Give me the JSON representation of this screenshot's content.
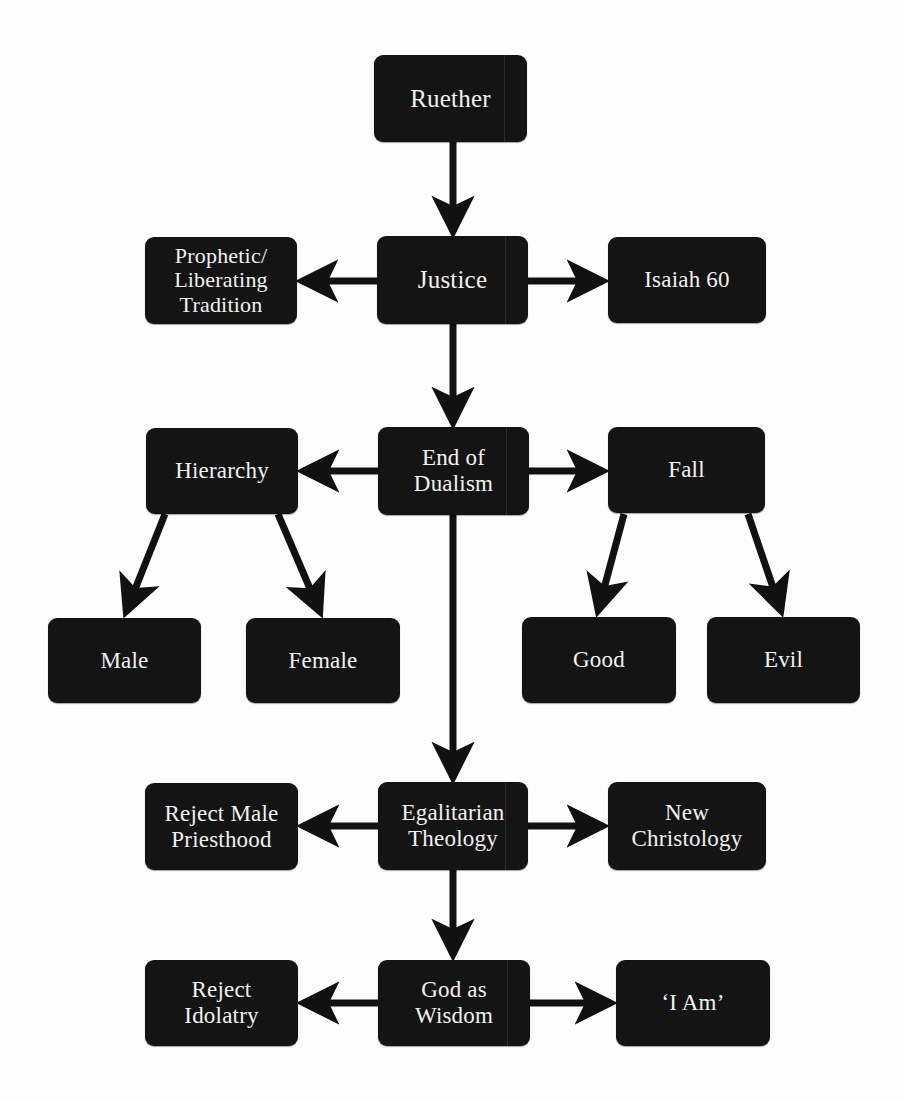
{
  "diagram": {
    "background_color": "#fdfdfc",
    "node_color": "#141414",
    "text_color": "#f2f2f0",
    "edge_color": "#111111",
    "nodes": [
      {
        "id": "ruether",
        "label": "Ruether",
        "x": 374,
        "y": 55,
        "w": 153,
        "h": 87,
        "size": "s-lg",
        "artifact": true
      },
      {
        "id": "prophetic",
        "label": "Prophetic/\nLiberating\nTradition",
        "x": 145,
        "y": 237,
        "w": 152,
        "h": 87,
        "size": "s-sm",
        "artifact": false
      },
      {
        "id": "justice",
        "label": "Justice",
        "x": 377,
        "y": 236,
        "w": 151,
        "h": 88,
        "size": "s-lg",
        "artifact": true
      },
      {
        "id": "isaiah60",
        "label": "Isaiah 60",
        "x": 608,
        "y": 237,
        "w": 158,
        "h": 86,
        "size": "s-md",
        "artifact": false
      },
      {
        "id": "hierarchy",
        "label": "Hierarchy",
        "x": 146,
        "y": 428,
        "w": 152,
        "h": 86,
        "size": "s-md",
        "artifact": false
      },
      {
        "id": "end-dualism",
        "label": "End of\nDualism",
        "x": 378,
        "y": 427,
        "w": 151,
        "h": 88,
        "size": "s-md",
        "artifact": true
      },
      {
        "id": "fall",
        "label": "Fall",
        "x": 608,
        "y": 427,
        "w": 157,
        "h": 86,
        "size": "s-md",
        "artifact": false
      },
      {
        "id": "male",
        "label": "Male",
        "x": 48,
        "y": 618,
        "w": 153,
        "h": 85,
        "size": "s-md",
        "artifact": false
      },
      {
        "id": "female",
        "label": "Female",
        "x": 246,
        "y": 618,
        "w": 154,
        "h": 85,
        "size": "s-md",
        "artifact": false
      },
      {
        "id": "good",
        "label": "Good",
        "x": 522,
        "y": 617,
        "w": 154,
        "h": 86,
        "size": "s-md",
        "artifact": false
      },
      {
        "id": "evil",
        "label": "Evil",
        "x": 707,
        "y": 617,
        "w": 153,
        "h": 86,
        "size": "s-md",
        "artifact": false
      },
      {
        "id": "reject-male",
        "label": "Reject Male\nPriesthood",
        "x": 145,
        "y": 783,
        "w": 153,
        "h": 87,
        "size": "s-md",
        "artifact": false
      },
      {
        "id": "egalitarian",
        "label": "Egalitarian\nTheology",
        "x": 378,
        "y": 782,
        "w": 150,
        "h": 88,
        "size": "s-md",
        "artifact": true
      },
      {
        "id": "christology",
        "label": "New\nChristology",
        "x": 608,
        "y": 782,
        "w": 158,
        "h": 88,
        "size": "s-md",
        "artifact": false
      },
      {
        "id": "reject-idol",
        "label": "Reject\nIdolatry",
        "x": 145,
        "y": 960,
        "w": 153,
        "h": 86,
        "size": "s-md",
        "artifact": false
      },
      {
        "id": "god-wisdom",
        "label": "God as\nWisdom",
        "x": 378,
        "y": 960,
        "w": 152,
        "h": 86,
        "size": "s-md",
        "artifact": true
      },
      {
        "id": "i-am",
        "label": "‘I Am’",
        "x": 616,
        "y": 960,
        "w": 154,
        "h": 86,
        "size": "s-md",
        "artifact": false
      }
    ],
    "edges": [
      {
        "from": "ruether",
        "to": "justice",
        "kind": "vertical-down"
      },
      {
        "from": "justice",
        "to": "prophetic",
        "kind": "horizontal-left"
      },
      {
        "from": "justice",
        "to": "isaiah60",
        "kind": "horizontal-right"
      },
      {
        "from": "justice",
        "to": "end-dualism",
        "kind": "vertical-down"
      },
      {
        "from": "end-dualism",
        "to": "hierarchy",
        "kind": "horizontal-left"
      },
      {
        "from": "end-dualism",
        "to": "fall",
        "kind": "horizontal-right"
      },
      {
        "from": "end-dualism",
        "to": "egalitarian",
        "kind": "vertical-down"
      },
      {
        "from": "hierarchy",
        "to": "male",
        "kind": "diagonal-down-left"
      },
      {
        "from": "hierarchy",
        "to": "female",
        "kind": "diagonal-down-right"
      },
      {
        "from": "fall",
        "to": "good",
        "kind": "diagonal-down-left"
      },
      {
        "from": "fall",
        "to": "evil",
        "kind": "diagonal-down-right"
      },
      {
        "from": "egalitarian",
        "to": "reject-male",
        "kind": "horizontal-left"
      },
      {
        "from": "egalitarian",
        "to": "christology",
        "kind": "horizontal-right"
      },
      {
        "from": "egalitarian",
        "to": "god-wisdom",
        "kind": "vertical-down"
      },
      {
        "from": "god-wisdom",
        "to": "reject-idol",
        "kind": "horizontal-left"
      },
      {
        "from": "god-wisdom",
        "to": "i-am",
        "kind": "horizontal-right"
      }
    ]
  }
}
